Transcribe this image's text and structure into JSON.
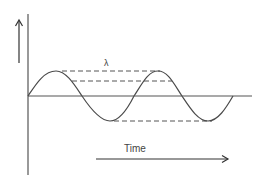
{
  "diagram": {
    "type": "wave-wavelength",
    "labels": {
      "wavelength": "λ",
      "time_axis": "Time"
    },
    "colors": {
      "stroke": "#4a4a4a",
      "dashed": "#555555",
      "background": "#ffffff"
    },
    "elements": {
      "vertical_axis": "displacement axis",
      "up_arrow": "amplitude direction arrow",
      "baseline": "equilibrium line",
      "wave": "sine wave, ~2 cycles",
      "dashed_lines": [
        "peak-to-peak wavelength",
        "mid-level wavelength",
        "trough-to-trough wavelength"
      ],
      "time_arrow": "time direction arrow"
    }
  }
}
